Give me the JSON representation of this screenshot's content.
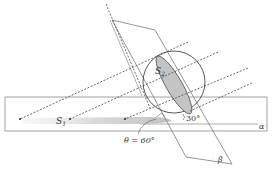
{
  "diagram": {
    "type": "geometry-projection",
    "labels": {
      "section": "S",
      "section_sub": "2",
      "shadow": "S",
      "shadow_sub": "1",
      "plane_alpha": "α",
      "plane_beta": "β",
      "angle_ray": "30°",
      "angle_theta": "θ = 60°"
    },
    "colors": {
      "line": "#555555",
      "plane": "#7a7a7a",
      "section_fill": "#c8c8c8",
      "shadow_fill": "#dcdcdc",
      "background": "#ffffff"
    },
    "values": {
      "ray_angle_deg": 30,
      "theta_deg": 60
    }
  }
}
